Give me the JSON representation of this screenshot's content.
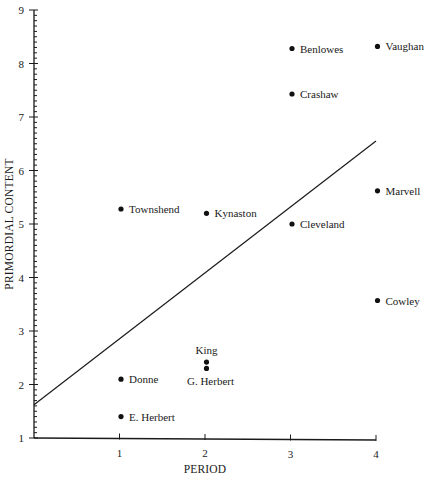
{
  "chart_data": {
    "type": "scatter",
    "title": "",
    "xlabel": "PERIOD",
    "ylabel": "PRIMORDIAL CONTENT",
    "xlim": [
      0,
      4
    ],
    "ylim": [
      1,
      9
    ],
    "x_ticks": [
      1,
      2,
      3,
      4
    ],
    "y_ticks": [
      1,
      2,
      3,
      4,
      5,
      6,
      7,
      8,
      9
    ],
    "y_minor_step": 0.1,
    "grid": false,
    "legend": null,
    "points": [
      {
        "label": "Benlowes",
        "x": 3,
        "y": 8.28,
        "label_pos": "right"
      },
      {
        "label": "Vaughan",
        "x": 4,
        "y": 8.32,
        "label_pos": "right"
      },
      {
        "label": "Crashaw",
        "x": 3,
        "y": 7.43,
        "label_pos": "right"
      },
      {
        "label": "Marvell",
        "x": 4,
        "y": 5.62,
        "label_pos": "right"
      },
      {
        "label": "Townshend",
        "x": 1,
        "y": 5.28,
        "label_pos": "right"
      },
      {
        "label": "Kynaston",
        "x": 2,
        "y": 5.2,
        "label_pos": "right"
      },
      {
        "label": "Cleveland",
        "x": 3,
        "y": 5.0,
        "label_pos": "right"
      },
      {
        "label": "Cowley",
        "x": 4,
        "y": 3.57,
        "label_pos": "right"
      },
      {
        "label": "King",
        "x": 2,
        "y": 2.42,
        "label_pos": "above"
      },
      {
        "label": "G. Herbert",
        "x": 2,
        "y": 2.3,
        "label_pos": "below"
      },
      {
        "label": "Donne",
        "x": 1,
        "y": 2.1,
        "label_pos": "right"
      },
      {
        "label": "E. Herbert",
        "x": 1,
        "y": 1.4,
        "label_pos": "right"
      }
    ],
    "regression_line": {
      "x0": 0,
      "y0": 1.62,
      "x1": 4,
      "y1": 6.55
    }
  }
}
